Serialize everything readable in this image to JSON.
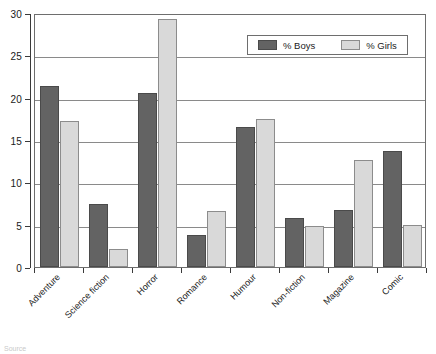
{
  "chart_data": {
    "type": "bar",
    "title": "",
    "xlabel": "",
    "ylabel": "",
    "ylim": [
      0,
      30
    ],
    "yticks": [
      0,
      5,
      10,
      15,
      20,
      25,
      30
    ],
    "grid": true,
    "legend_position": "top-right",
    "categories": [
      "Adventure",
      "Science fiction",
      "Horror",
      "Romance",
      "Humour",
      "Non-fiction",
      "Magazine",
      "Comic"
    ],
    "series": [
      {
        "name": "% Boys",
        "color": "#636363",
        "values": [
          21.4,
          7.5,
          20.5,
          3.8,
          16.5,
          5.8,
          6.7,
          13.7
        ]
      },
      {
        "name": "% Girls",
        "color": "#d9d9d9",
        "values": [
          17.3,
          2.1,
          29.3,
          6.6,
          17.5,
          4.9,
          12.6,
          5.0
        ]
      }
    ]
  },
  "legend": {
    "items": [
      {
        "label": "% Boys",
        "swatch": "boys"
      },
      {
        "label": "% Girls",
        "swatch": "girls"
      }
    ]
  },
  "footer": {
    "caption": "Source"
  }
}
